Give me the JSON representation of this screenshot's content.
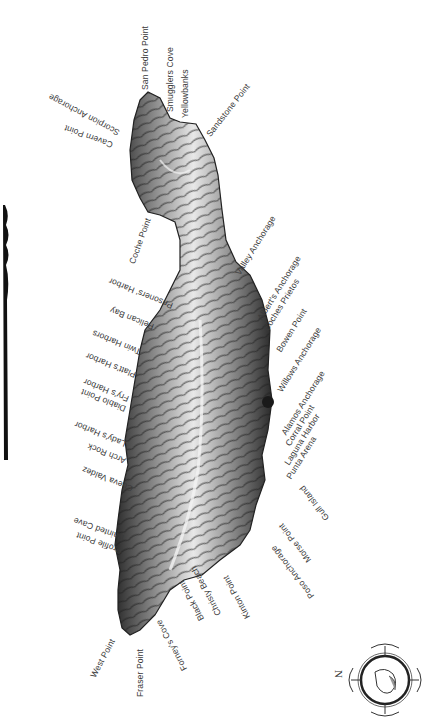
{
  "map": {
    "title": "Santa Cruz Island place names",
    "orientation": "rotated; north points left",
    "colors": {
      "land_dark": "#1e1e1e",
      "land_mid": "#8a8a8a",
      "land_light": "#e6e6e6",
      "label": "#3a3a3a",
      "background": "#ffffff"
    },
    "labels": [
      {
        "id": "san-pedro-point",
        "text": "San Pedro Point"
      },
      {
        "id": "smugglers-cove",
        "text": "Smugglers Cove"
      },
      {
        "id": "yellowbanks",
        "text": "Yellowbanks"
      },
      {
        "id": "sandstone-point",
        "text": "Sandstone Point"
      },
      {
        "id": "scorpion-anchorage",
        "text": "Scorpion Anchorage"
      },
      {
        "id": "cavern-point",
        "text": "Cavern Point"
      },
      {
        "id": "coche-point",
        "text": "Coche Point"
      },
      {
        "id": "valley-anchorage",
        "text": "Valley Anchorage"
      },
      {
        "id": "alberts-anchorage",
        "text": "Albert's Anchorage"
      },
      {
        "id": "coches-prietos",
        "text": "Coches Prietos"
      },
      {
        "id": "bowen-point",
        "text": "Bowen Point"
      },
      {
        "id": "willows-anchorage",
        "text": "Willows Anchorage"
      },
      {
        "id": "alamos-anchorage",
        "text": "Alamos Anchorage"
      },
      {
        "id": "corral-point",
        "text": "Corral Point"
      },
      {
        "id": "laguna-harbor",
        "text": "Laguna Harbor"
      },
      {
        "id": "punta-arena",
        "text": "Punta Arena"
      },
      {
        "id": "gull-island",
        "text": "Gull Island"
      },
      {
        "id": "morse-point",
        "text": "Morse Point"
      },
      {
        "id": "poso-anchorage",
        "text": "Poso Anchorage"
      },
      {
        "id": "kinton-point",
        "text": "Kinton Point"
      },
      {
        "id": "christy-beach",
        "text": "Christy Beach"
      },
      {
        "id": "black-point",
        "text": "Black Point"
      },
      {
        "id": "forneys-cove",
        "text": "Forney's Cove"
      },
      {
        "id": "fraser-point",
        "text": "Fraser Point"
      },
      {
        "id": "west-point",
        "text": "West Point"
      },
      {
        "id": "profile-point",
        "text": "Profile Point"
      },
      {
        "id": "painted-cave",
        "text": "Painted Cave"
      },
      {
        "id": "cueva-valdez",
        "text": "Cueva Valdez"
      },
      {
        "id": "arch-rock",
        "text": "Arch Rock"
      },
      {
        "id": "ladys-harbor",
        "text": "Lady's Harbor"
      },
      {
        "id": "diablo-point",
        "text": "Diablo Point"
      },
      {
        "id": "frys-harbor",
        "text": "Fry's Harbor"
      },
      {
        "id": "platts-harbor",
        "text": "Platt's Harbor"
      },
      {
        "id": "twin-harbors",
        "text": "Twin Harbors"
      },
      {
        "id": "pelican-bay",
        "text": "Pelican Bay"
      },
      {
        "id": "prisoners-harbor",
        "text": "Prisoners' Harbor"
      }
    ],
    "compass": {
      "north_label": "N",
      "icon": "compass-rose-icon"
    },
    "scale_bar": {
      "icon": "scale-bar-icon"
    }
  }
}
